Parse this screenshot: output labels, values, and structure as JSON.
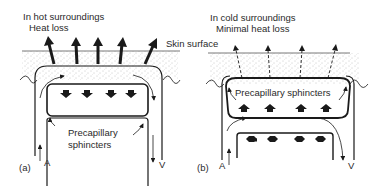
{
  "figure": {
    "panel_a": {
      "letter": "(a)",
      "title_line1": "In hot surroundings",
      "title_line2": "Heat loss",
      "skin_label": "Skin surface",
      "sphincter_label_line1": "Precapillary",
      "sphincter_label_line2": "sphincters",
      "artery_label": "A",
      "vein_label": "V",
      "heat_arrows": 5,
      "heat_arrow_style": "solid-thick"
    },
    "panel_b": {
      "letter": "(b)",
      "title_line1": "In cold surroundings",
      "title_line2": "Minimal heat loss",
      "sphincter_label": "Precapillary sphincters",
      "artery_label": "A",
      "vein_label": "V",
      "heat_arrows": 4,
      "heat_arrow_style": "dashed-thin"
    },
    "colors": {
      "ink": "#1a1a1a",
      "skin_stipple": "#9a9a9a",
      "background": "#ffffff"
    }
  }
}
